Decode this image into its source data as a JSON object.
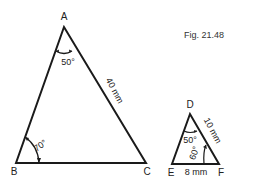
{
  "figure": {
    "caption": "Fig. 21.48"
  },
  "triangle_abc": {
    "vertices": {
      "A": "A",
      "B": "B",
      "C": "C"
    },
    "angle_a": "50°",
    "angle_b": "70°",
    "side_ac": "40 mm"
  },
  "triangle_def": {
    "vertices": {
      "D": "D",
      "E": "E",
      "F": "F"
    },
    "angle_d": "50°",
    "angle_f": "60°",
    "side_df": "10 mm",
    "side_ef": "8 mm"
  },
  "colors": {
    "line": "#1a1a1a",
    "background": "#ffffff"
  }
}
